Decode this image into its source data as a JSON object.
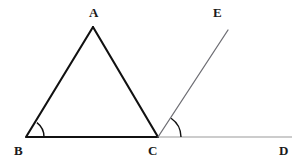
{
  "figure": {
    "background_color": "#ffffff",
    "width": 304,
    "height": 166
  },
  "labels": {
    "a": "A",
    "b": "B",
    "c": "C",
    "d": "D",
    "e": "E"
  },
  "label_positions": {
    "a": {
      "x": 89,
      "y": 6
    },
    "b": {
      "x": 14,
      "y": 144
    },
    "c": {
      "x": 148,
      "y": 144
    },
    "d": {
      "x": 279,
      "y": 144
    },
    "e": {
      "x": 213,
      "y": 6
    }
  },
  "points": {
    "A": {
      "x": 93,
      "y": 27
    },
    "B": {
      "x": 26,
      "y": 137
    },
    "C": {
      "x": 158,
      "y": 137
    },
    "D": {
      "x": 292,
      "y": 137
    },
    "E": {
      "x": 228,
      "y": 30
    }
  },
  "segments": [
    {
      "name": "side-ab",
      "from": "B",
      "to": "A",
      "color": "#111111",
      "width": 2.1,
      "x1": 26,
      "y1": 137,
      "x2": 93,
      "y2": 27
    },
    {
      "name": "side-ac",
      "from": "A",
      "to": "C",
      "color": "#111111",
      "width": 2.1,
      "x1": 93,
      "y1": 27,
      "x2": 158,
      "y2": 137
    },
    {
      "name": "side-bc",
      "from": "B",
      "to": "C",
      "color": "#111111",
      "width": 2.1,
      "x1": 26,
      "y1": 137,
      "x2": 158,
      "y2": 137
    },
    {
      "name": "segment-cd",
      "from": "C",
      "to": "D",
      "color": "#9a9a9a",
      "width": 1.2,
      "x1": 158,
      "y1": 137,
      "x2": 292,
      "y2": 137
    },
    {
      "name": "ray-ce",
      "from": "C",
      "to": "E",
      "color": "#6e6e74",
      "width": 1.3,
      "x1": 158,
      "y1": 137,
      "x2": 228,
      "y2": 30
    }
  ],
  "angle_arcs": [
    {
      "name": "angle-arc-b",
      "vertex": "B",
      "color": "#111111",
      "width": 1.4,
      "radius": 18,
      "path": "M 44 137 A 18 18 0 0 0 36.91 122.62"
    },
    {
      "name": "angle-arc-c",
      "vertex": "C",
      "color": "#111111",
      "width": 1.4,
      "radius": 23,
      "path": "M 181 137 A 23 23 0 0 0 171.06 118.21"
    }
  ],
  "colors": {
    "stroke_dark": "#111111",
    "stroke_gray": "#9a9a9a",
    "stroke_ray": "#6e6e74",
    "label_text": "#1a1a1a",
    "background": "#ffffff"
  }
}
